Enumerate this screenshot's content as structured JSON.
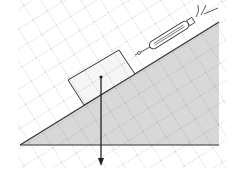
{
  "diagram": {
    "type": "inclined-plane-physics",
    "elements": [
      "dashed-grid",
      "incline",
      "ground-line",
      "block",
      "spring-dynamometer",
      "gravity-arrow"
    ],
    "colors": {
      "incline_fill": "#d4d4d4",
      "line": "#333333",
      "grid": "#888888",
      "block_fill": "#f4f4f4"
    }
  }
}
